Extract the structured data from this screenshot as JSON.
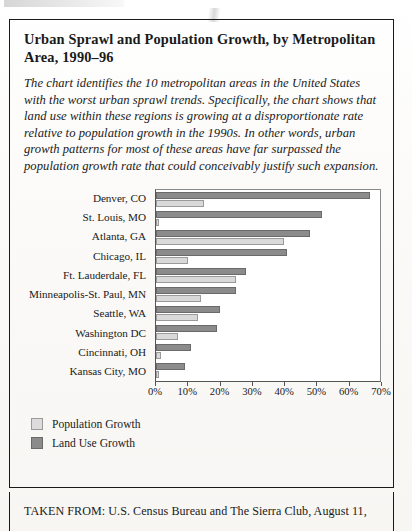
{
  "figure": {
    "title": "Urban Sprawl and Population Growth, by Metropolitan Area, 1990–96",
    "description": "The chart identifies the 10 metropolitan areas in the United States with the worst urban sprawl trends. Specifically, the chart shows that land use within these regions is growing at a disproportionate rate relative to population growth in the 1990s. In other words, urban growth patterns for most of these areas have far surpassed the population growth rate that could conceivably justify such expansion."
  },
  "source": {
    "text": "TAKEN FROM: U.S. Census Bureau and The Sierra Club, August 11,"
  },
  "legend": {
    "items": [
      {
        "label": "Population Growth",
        "key": "pop",
        "color": "#dcdcdc"
      },
      {
        "label": "Land Use Growth",
        "key": "land",
        "color": "#8b8b8b"
      }
    ]
  },
  "chart_data": {
    "type": "bar",
    "orientation": "horizontal",
    "title": "Urban Sprawl and Population Growth, by Metropolitan Area, 1990–96",
    "xlabel": "",
    "ylabel": "",
    "xlim": [
      0,
      70
    ],
    "xticks": [
      0,
      10,
      20,
      30,
      40,
      50,
      60,
      70
    ],
    "xtick_labels": [
      "0%",
      "10%",
      "20%",
      "30%",
      "40%",
      "50%",
      "60%",
      "70%"
    ],
    "grid": false,
    "legend_position": "below-left",
    "categories": [
      "Denver, CO",
      "St. Louis, MO",
      "Atlanta, GA",
      "Chicago, IL",
      "Ft. Lauderdale, FL",
      "Minneapolis-St. Paul, MN",
      "Seattle, WA",
      "Washington DC",
      "Cincinnati, OH",
      "Kansas City, MO"
    ],
    "series": [
      {
        "name": "Land Use Growth",
        "color": "#8b8b8b",
        "values": [
          67,
          52,
          48,
          41,
          28,
          25,
          20,
          19,
          11,
          9
        ]
      },
      {
        "name": "Population Growth",
        "color": "#dcdcdc",
        "values": [
          15,
          1,
          40,
          10,
          25,
          14,
          13,
          7,
          1.5,
          1
        ]
      }
    ]
  }
}
